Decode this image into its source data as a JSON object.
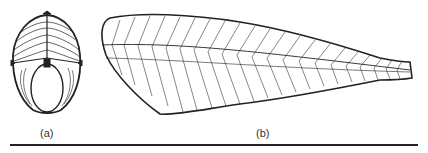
{
  "figure": {
    "panels": [
      {
        "id": "a",
        "label": "(a)",
        "description": "cross-section of fish body showing myomere arrangement"
      },
      {
        "id": "b",
        "label": "(b)",
        "description": "lateral view of fish body showing W-shaped myomeres"
      }
    ],
    "colors": {
      "stroke": "#222222",
      "background": "#ffffff"
    }
  }
}
